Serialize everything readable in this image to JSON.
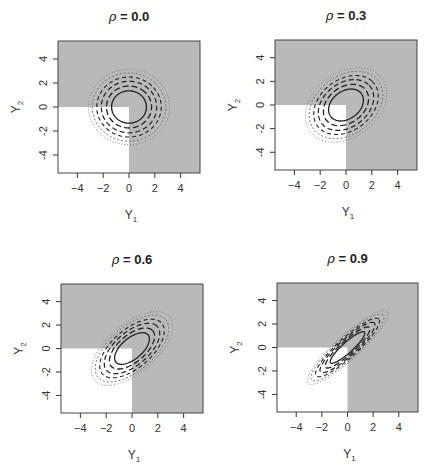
{
  "chart_data": [
    {
      "type": "contour",
      "title": "ρ = 0.0",
      "title_rho": "ρ",
      "title_value": " = 0.0",
      "rho": 0.0,
      "xlabel": "Y1",
      "ylabel": "Y2",
      "xticks": [
        -4,
        -2,
        0,
        2,
        4
      ],
      "yticks": [
        -4,
        -2,
        0,
        2,
        4
      ],
      "xlim": [
        -5.5,
        5.5
      ],
      "ylim": [
        -5.5,
        5.5
      ],
      "shaded_region": "all except Y1<0 and Y2<0 (gray)",
      "contours": "bivariate normal density, solid inner + dashed + dotted outer",
      "grid": false
    },
    {
      "type": "contour",
      "title": "ρ = 0.3",
      "title_rho": "ρ",
      "title_value": " = 0.3",
      "rho": 0.3,
      "xlabel": "Y1",
      "ylabel": "Y2",
      "xticks": [
        -4,
        -2,
        0,
        2,
        4
      ],
      "yticks": [
        -4,
        -2,
        0,
        2,
        4
      ],
      "xlim": [
        -5.5,
        5.5
      ],
      "ylim": [
        -5.5,
        5.5
      ],
      "grid": false
    },
    {
      "type": "contour",
      "title": "ρ = 0.6",
      "title_rho": "ρ",
      "title_value": " = 0.6",
      "rho": 0.6,
      "xlabel": "Y1",
      "ylabel": "Y2",
      "xticks": [
        -4,
        -2,
        0,
        2,
        4
      ],
      "yticks": [
        -4,
        -2,
        0,
        2,
        4
      ],
      "xlim": [
        -5.5,
        5.5
      ],
      "ylim": [
        -5.5,
        5.5
      ],
      "grid": false
    },
    {
      "type": "contour",
      "title": "ρ = 0.9",
      "title_rho": "ρ",
      "title_value": " = 0.9",
      "rho": 0.9,
      "xlabel": "Y1",
      "ylabel": "Y2",
      "xticks": [
        -4,
        -2,
        0,
        2,
        4
      ],
      "yticks": [
        -4,
        -2,
        0,
        2,
        4
      ],
      "xlim": [
        -5.5,
        5.5
      ],
      "ylim": [
        -5.5,
        5.5
      ],
      "grid": false
    }
  ],
  "labels": {
    "y1": "Y",
    "y1_sub": "1",
    "y2": "Y",
    "y2_sub": "2",
    "ticks": [
      "−4",
      "−2",
      "0",
      "2",
      "4"
    ],
    "yticks": [
      "-4",
      "-2",
      "0",
      "2",
      "4"
    ]
  },
  "colors": {
    "shade": "#b9b9b9",
    "line": "#222222",
    "dotted": "#777777"
  }
}
